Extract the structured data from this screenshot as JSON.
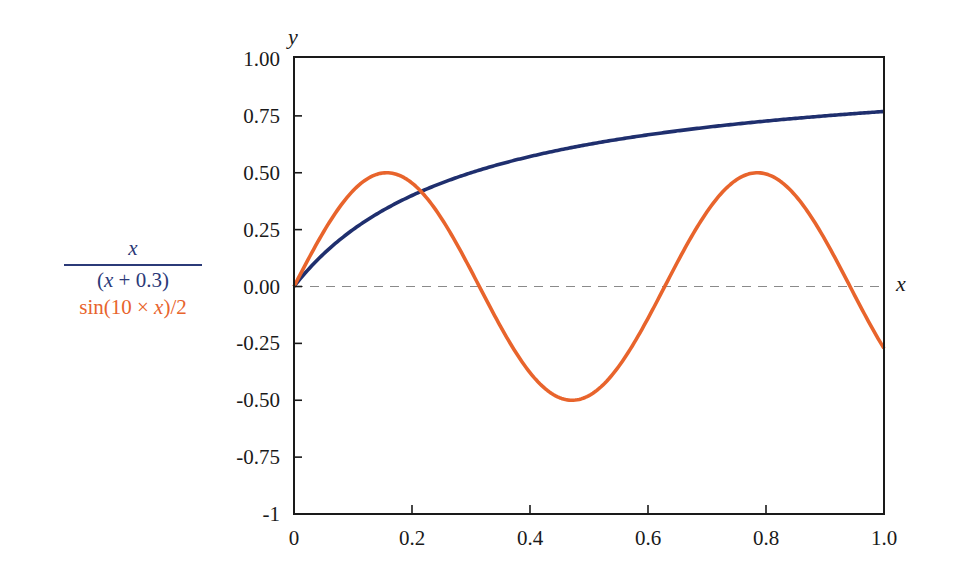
{
  "chart_data": {
    "type": "line",
    "title": "",
    "xlabel": "x",
    "ylabel": "y",
    "xlim": [
      0,
      1.0
    ],
    "ylim": [
      -1,
      1.0
    ],
    "grid": false,
    "legend_position": "left",
    "x_ticks": [
      0,
      0.2,
      0.4,
      0.6,
      0.8,
      1.0
    ],
    "x_tick_labels": [
      "0",
      "0.2",
      "0.4",
      "0.6",
      "0.8",
      "1.0"
    ],
    "y_ticks": [
      1.0,
      0.75,
      0.5,
      0.25,
      0.0,
      -0.25,
      -0.5,
      -0.75,
      -1
    ],
    "y_tick_labels": [
      "1.00",
      "0.75",
      "0.50",
      "0.25",
      "0.00",
      "-0.25",
      "-0.50",
      "-0.75",
      "-1"
    ],
    "reference_line": {
      "y": 0,
      "style": "dashed",
      "color": "#8a8a8a"
    },
    "series": [
      {
        "name": "x/(x+0.3)",
        "color": "#1f2f6e",
        "x": [
          0,
          0.05,
          0.1,
          0.15,
          0.2,
          0.25,
          0.3,
          0.35,
          0.4,
          0.45,
          0.5,
          0.55,
          0.6,
          0.65,
          0.7,
          0.75,
          0.8,
          0.85,
          0.9,
          0.95,
          1.0
        ],
        "values": [
          0,
          0.143,
          0.25,
          0.333,
          0.4,
          0.455,
          0.5,
          0.538,
          0.571,
          0.6,
          0.625,
          0.647,
          0.667,
          0.684,
          0.7,
          0.714,
          0.727,
          0.739,
          0.75,
          0.76,
          0.769
        ]
      },
      {
        "name": "sin(10×x)/2",
        "color": "#e8642c",
        "x": [
          0,
          0.05,
          0.1,
          0.15,
          0.2,
          0.25,
          0.3,
          0.35,
          0.4,
          0.45,
          0.5,
          0.55,
          0.6,
          0.65,
          0.7,
          0.75,
          0.8,
          0.85,
          0.9,
          0.95,
          1.0
        ],
        "values": [
          0,
          0.24,
          0.421,
          0.499,
          0.455,
          0.299,
          0.071,
          -0.175,
          -0.378,
          -0.489,
          -0.479,
          -0.353,
          -0.14,
          0.108,
          0.328,
          0.469,
          0.495,
          0.399,
          0.206,
          -0.037,
          -0.272
        ]
      }
    ]
  },
  "legend": {
    "s1_num": "x",
    "s1_den_open": "(",
    "s1_den_var": "x",
    "s1_den_rest": " + 0.3)",
    "s2_prefix": "sin(10 × ",
    "s2_var": "x",
    "s2_suffix": ")/2"
  }
}
